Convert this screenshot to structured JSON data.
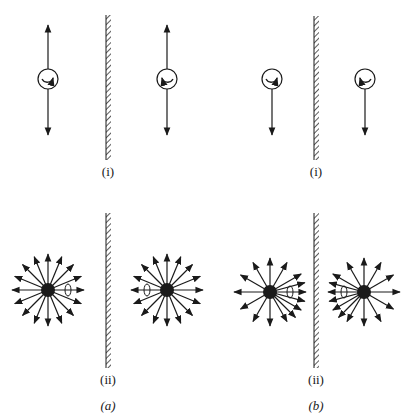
{
  "figure": {
    "panels": [
      {
        "id": "a",
        "label": "(a)",
        "wall_x": 108,
        "sub": [
          {
            "id": "i",
            "label": "(i)",
            "description": "Dipoles parallel to mirror with image; rotating arrow in circle",
            "dipoles": [
              {
                "cx": 48,
                "cy": 79,
                "r": 10,
                "arrow_up": true,
                "arrow_down": true,
                "rot": "cw"
              },
              {
                "cx": 167,
                "cy": 79,
                "r": 10,
                "arrow_up": true,
                "arrow_down": true,
                "rot": "ccw"
              }
            ]
          },
          {
            "id": "ii",
            "label": "(ii)",
            "description": "Isotropic radiation pattern with 16 rays",
            "stars": [
              {
                "cx": 48,
                "cy": 290,
                "rays": 16,
                "spin_side": "right"
              },
              {
                "cx": 167,
                "cy": 290,
                "rays": 16,
                "spin_side": "left"
              }
            ]
          }
        ]
      },
      {
        "id": "b",
        "label": "(b)",
        "wall_x": 316,
        "sub": [
          {
            "id": "i",
            "label": "(i)",
            "description": "Dipoles with single downward arrow",
            "dipoles": [
              {
                "cx": 272,
                "cy": 79,
                "r": 10,
                "arrow_up": false,
                "arrow_down": true,
                "rot": "cw"
              },
              {
                "cx": 365,
                "cy": 79,
                "r": 10,
                "arrow_up": false,
                "arrow_down": true,
                "rot": "ccw"
              }
            ]
          },
          {
            "id": "ii",
            "label": "(ii)",
            "description": "Anisotropic radiation pattern, denser toward mirror",
            "stars": [
              {
                "cx": 270,
                "cy": 292,
                "spin_side": "right"
              },
              {
                "cx": 364,
                "cy": 292,
                "spin_side": "left"
              }
            ]
          }
        ]
      }
    ],
    "colors": {
      "ink": "#1a1a1a",
      "background": "#ffffff"
    }
  }
}
